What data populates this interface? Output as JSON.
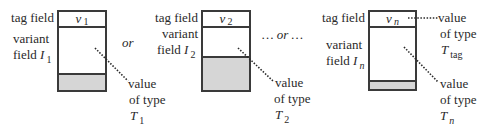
{
  "diagram": {
    "panels": [
      {
        "tag_label": "tag field",
        "variant_label_line1": "variant",
        "variant_label_line2": "field",
        "variant_symbol": "I",
        "variant_sub": "1",
        "tag_value": "v",
        "tag_value_sub": "1",
        "value_label_line1": "value",
        "value_label_line2": "of type",
        "type_symbol": "T",
        "type_sub": "1"
      },
      {
        "tag_label": "tag field",
        "variant_label_line1": "variant",
        "variant_label_line2": "field",
        "variant_symbol": "I",
        "variant_sub": "2",
        "tag_value": "v",
        "tag_value_sub": "2",
        "value_label_line1": "value",
        "value_label_line2": "of type",
        "type_symbol": "T",
        "type_sub": "2"
      },
      {
        "tag_label": "tag field",
        "variant_label_line1": "variant",
        "variant_label_line2": "field",
        "variant_symbol": "I",
        "variant_sub": "n",
        "tag_value": "v",
        "tag_value_sub": "n",
        "value_label_line1": "value",
        "value_label_line2": "of type",
        "type_symbol": "T",
        "type_sub": "n",
        "tag_type_label_line1": "value",
        "tag_type_label_line2": "of type",
        "tag_type_symbol": "T",
        "tag_type_sub": "tag"
      }
    ],
    "separators": [
      "or",
      "… or …"
    ],
    "colors": {
      "stroke": "#3a3a3a",
      "shade": "#d6d6d6"
    }
  }
}
